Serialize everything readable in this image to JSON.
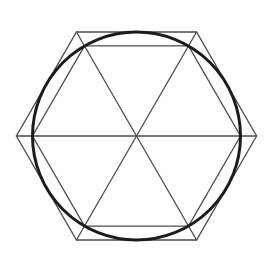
{
  "figure": {
    "canvas": {
      "width": 273,
      "height": 256
    },
    "background_color": "#fefefe",
    "center": {
      "x": 136.5,
      "y": 136
    },
    "circle": {
      "radius": 104,
      "stroke_color": "#1c1c1c",
      "stroke_width": 3
    },
    "outer_hexagon": {
      "circumradius": 120.1,
      "orientation_deg": 0,
      "stroke_color": "#4a4c4f",
      "stroke_width": 1.3
    },
    "inner_hexagon": {
      "circumradius": 104,
      "orientation_deg": 0,
      "stroke_color": "#4a4c4f",
      "stroke_width": 1.3
    },
    "diagonals": {
      "count": 3,
      "connects": "opposite outer hexagon vertices through center",
      "stroke_color": "#4a4c4f",
      "stroke_width": 1.3
    }
  }
}
